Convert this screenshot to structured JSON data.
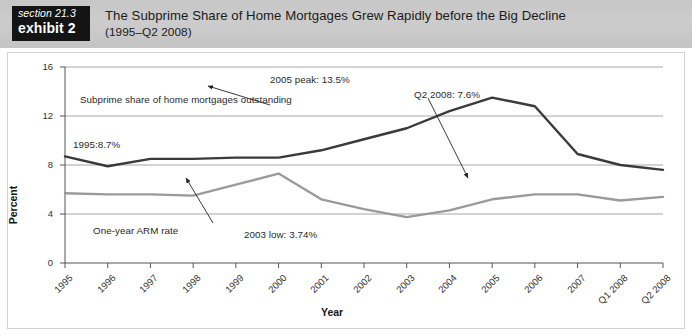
{
  "header": {
    "badge_section": "section 21.3",
    "badge_exhibit": "exhibit 2",
    "title": "The Subprime Share of Home Mortgages Grew Rapidly before the Big Decline",
    "subtitle": "(1995–Q2 2008)"
  },
  "colors": {
    "header_band": "#c9c9c9",
    "badge_bg": "#141414",
    "subprime_line": "#3a3a3a",
    "arm_line": "#9a9a9a",
    "gridline": "#8f8f8f",
    "axis": "#555555",
    "frame_border": "#d2d2d2"
  },
  "chart_data": {
    "type": "line",
    "title": "The Subprime Share of Home Mortgages Grew Rapidly before the Big Decline",
    "subtitle": "(1995–Q2 2008)",
    "xlabel": "Year",
    "ylabel": "Percent",
    "ylim": [
      0,
      16
    ],
    "yticks": [
      0,
      4,
      8,
      12,
      16
    ],
    "grid": true,
    "legend": "none",
    "categories": [
      "1995",
      "1996",
      "1997",
      "1998",
      "1999",
      "2000",
      "2001",
      "2002",
      "2003",
      "2004",
      "2005",
      "2006",
      "2007",
      "Q1 2008",
      "Q2 2008"
    ],
    "series": [
      {
        "name": "Subprime share of home mortgages outstanding",
        "color": "#3a3a3a",
        "values": [
          8.7,
          7.9,
          8.5,
          8.5,
          8.6,
          8.6,
          9.2,
          10.1,
          11.0,
          12.4,
          13.5,
          12.8,
          8.9,
          8.0,
          7.6
        ]
      },
      {
        "name": "One-year ARM rate",
        "color": "#9a9a9a",
        "values": [
          5.7,
          5.6,
          5.6,
          5.5,
          6.4,
          7.3,
          5.2,
          4.4,
          3.74,
          4.3,
          5.2,
          5.6,
          5.6,
          5.1,
          5.4
        ]
      }
    ],
    "annotations": [
      {
        "id": "series-label-subprime",
        "text": "Subprime share of home mortgages outstanding"
      },
      {
        "id": "peak-2005",
        "text": "2005 peak: 13.5%"
      },
      {
        "id": "q2-2008",
        "text": "Q2 2008: 7.6%"
      },
      {
        "id": "start-1995",
        "text": "1995:8.7%"
      },
      {
        "id": "series-label-arm",
        "text": "One-year ARM rate"
      },
      {
        "id": "low-2003",
        "text": "2003 low: 3.74%"
      }
    ]
  }
}
